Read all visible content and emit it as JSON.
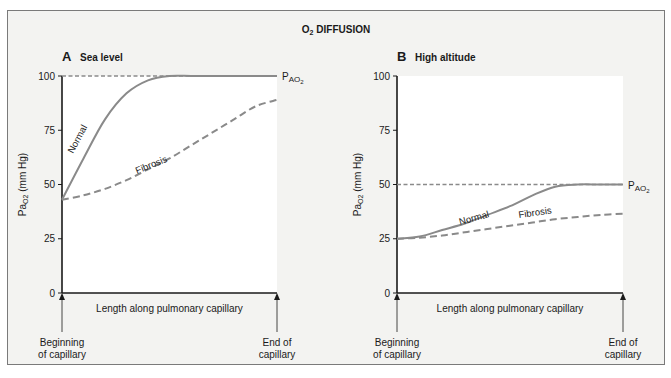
{
  "figure": {
    "title_prefix": "O",
    "title_sub": "2",
    "title_rest": " DIFFUSION"
  },
  "chart_data": [
    {
      "type": "line",
      "panel_letter": "A",
      "title": "Sea level",
      "xlabel": "Length along pulmonary capillary",
      "ylabel": "PaO2 (mm Hg)",
      "ylim": [
        0,
        100
      ],
      "yticks": [
        0,
        25,
        50,
        75,
        100
      ],
      "x_start_label": [
        "Beginning",
        "of capillary"
      ],
      "x_end_label": [
        "End of",
        "capillary"
      ],
      "reference_line": {
        "name": "PAO2",
        "value": 100,
        "style": "dotted"
      },
      "x": [
        0,
        0.1,
        0.2,
        0.3,
        0.4,
        0.5,
        0.6,
        0.7,
        0.8,
        0.9,
        1.0
      ],
      "series": [
        {
          "name": "Normal",
          "style": "solid",
          "values": [
            43,
            62,
            80,
            92,
            98,
            100,
            100,
            100,
            100,
            100,
            100
          ]
        },
        {
          "name": "Fibrosis",
          "style": "dashed",
          "values": [
            43,
            45,
            48,
            52,
            57,
            62,
            68,
            74,
            80,
            86,
            89
          ]
        }
      ]
    },
    {
      "type": "line",
      "panel_letter": "B",
      "title": "High altitude",
      "xlabel": "Length along pulmonary capillary",
      "ylabel": "PaO2 (mm Hg)",
      "ylim": [
        0,
        100
      ],
      "yticks": [
        0,
        25,
        50,
        75,
        100
      ],
      "x_start_label": [
        "Beginning",
        "of capillary"
      ],
      "x_end_label": [
        "End of",
        "capillary"
      ],
      "reference_line": {
        "name": "PAO2",
        "value": 50,
        "style": "dotted"
      },
      "x": [
        0,
        0.1,
        0.2,
        0.3,
        0.4,
        0.5,
        0.6,
        0.7,
        0.8,
        0.9,
        1.0
      ],
      "series": [
        {
          "name": "Normal",
          "style": "solid",
          "values": [
            25,
            26,
            29,
            32,
            36,
            40,
            45,
            49,
            50,
            50,
            50
          ]
        },
        {
          "name": "Fibrosis",
          "style": "dashed",
          "values": [
            25,
            25.5,
            26.5,
            28,
            29.5,
            31,
            32.5,
            34,
            35,
            36,
            36.5
          ]
        }
      ]
    }
  ],
  "colors": {
    "curve": "#8a8a8a",
    "axis": "#1a1a1a",
    "plot_bg": "#ffffff",
    "frame_bg": "#f3f3f1"
  }
}
